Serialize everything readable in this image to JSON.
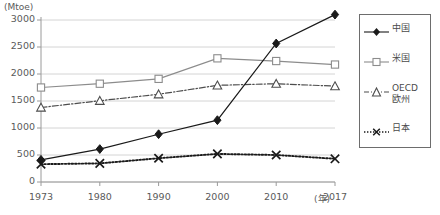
{
  "chart_data": {
    "type": "line",
    "title": "",
    "subtitle": "",
    "unit_label": "(Mtoe)",
    "xlabel": "(年)",
    "ylabel": "",
    "categories": [
      "1973",
      "1980",
      "1990",
      "2000",
      "2010",
      "2017"
    ],
    "x": [
      1973,
      1980,
      1990,
      2000,
      2010,
      2017
    ],
    "ylim": [
      0,
      3000
    ],
    "yticks": [
      0,
      500,
      1000,
      1500,
      2000,
      2500,
      3000
    ],
    "ytick_labels": [
      "0",
      "500",
      "1000",
      "1500",
      "2000",
      "2500",
      "3000"
    ],
    "grid": true,
    "legend_position": "right",
    "series": [
      {
        "name": "中国",
        "marker": "diamond",
        "line_style": "solid",
        "color": "#1a1a1a",
        "values": [
          410,
          610,
          885,
          1145,
          2565,
          3100
        ]
      },
      {
        "name": "米国",
        "marker": "square",
        "line_style": "solid",
        "color": "#8c8c8c",
        "values": [
          1750,
          1820,
          1910,
          2290,
          2240,
          2175
        ]
      },
      {
        "name": "OECD\n欧州",
        "marker": "triangle",
        "line_style": "dashdot",
        "color": "#4d4d4d",
        "values": [
          1380,
          1505,
          1625,
          1790,
          1820,
          1775
        ]
      },
      {
        "name": "日本",
        "marker": "x",
        "line_style": "dotted",
        "color": "#1a1a1a",
        "values": [
          330,
          345,
          440,
          520,
          500,
          430
        ]
      }
    ]
  },
  "legend": {
    "items": [
      {
        "label": "中国",
        "marker": "diamond-marker"
      },
      {
        "label": "米国",
        "marker": "square-marker"
      },
      {
        "label": "OECD\n欧州",
        "marker": "triangle-marker"
      },
      {
        "label": "日本",
        "marker": "x-marker"
      }
    ]
  },
  "axes": {
    "y_unit": "(Mtoe)",
    "x_unit": "(年)"
  }
}
